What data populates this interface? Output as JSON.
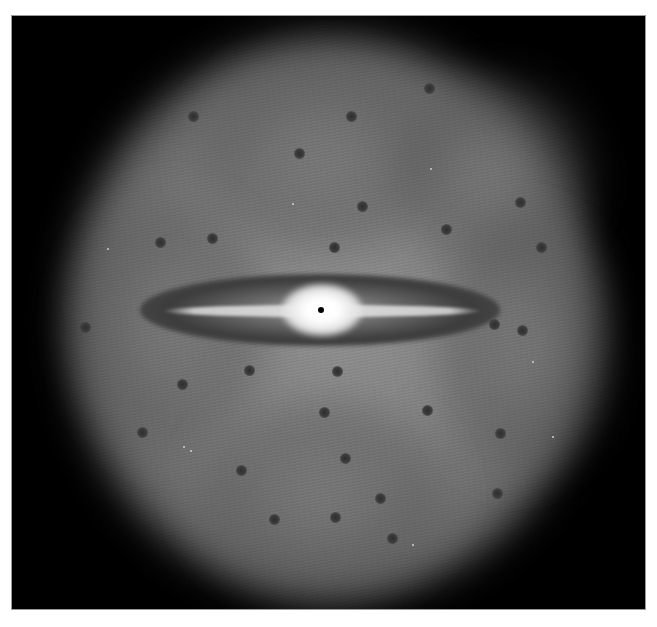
{
  "image": {
    "subject": "edge-on disk galaxy with bright central bulge and diffuse halo",
    "frame": {
      "left": 12,
      "top": 16,
      "width": 633,
      "height": 593
    },
    "colors": {
      "background": "#000000",
      "halo": "#858585",
      "disk_dark": "#3c3c3c",
      "bulge": "#ffffff",
      "border": "#9a9a9a"
    },
    "core": {
      "x": 309,
      "y": 294
    },
    "halo_lobes": [
      {
        "x": 180,
        "y": 40,
        "w": 260,
        "h": 200
      },
      {
        "x": 380,
        "y": 60,
        "w": 200,
        "h": 200
      },
      {
        "x": 60,
        "y": 180,
        "w": 200,
        "h": 260
      },
      {
        "x": 420,
        "y": 200,
        "w": 180,
        "h": 260
      },
      {
        "x": 180,
        "y": 380,
        "w": 260,
        "h": 200
      }
    ],
    "dark_spots": [
      {
        "x": 181,
        "y": 100
      },
      {
        "x": 339,
        "y": 100
      },
      {
        "x": 417,
        "y": 72
      },
      {
        "x": 287,
        "y": 137
      },
      {
        "x": 350,
        "y": 190
      },
      {
        "x": 200,
        "y": 222
      },
      {
        "x": 322,
        "y": 231
      },
      {
        "x": 434,
        "y": 213
      },
      {
        "x": 529,
        "y": 231
      },
      {
        "x": 508,
        "y": 186
      },
      {
        "x": 73,
        "y": 311
      },
      {
        "x": 482,
        "y": 308
      },
      {
        "x": 510,
        "y": 314
      },
      {
        "x": 237,
        "y": 354
      },
      {
        "x": 325,
        "y": 355
      },
      {
        "x": 170,
        "y": 368
      },
      {
        "x": 312,
        "y": 396
      },
      {
        "x": 415,
        "y": 394
      },
      {
        "x": 130,
        "y": 416
      },
      {
        "x": 488,
        "y": 417
      },
      {
        "x": 333,
        "y": 442
      },
      {
        "x": 229,
        "y": 454
      },
      {
        "x": 368,
        "y": 482
      },
      {
        "x": 485,
        "y": 477
      },
      {
        "x": 262,
        "y": 503
      },
      {
        "x": 323,
        "y": 501
      },
      {
        "x": 380,
        "y": 522
      },
      {
        "x": 148,
        "y": 226
      }
    ],
    "stars": [
      {
        "x": 280,
        "y": 187
      },
      {
        "x": 418,
        "y": 152
      },
      {
        "x": 178,
        "y": 434
      },
      {
        "x": 171,
        "y": 430
      },
      {
        "x": 540,
        "y": 420
      },
      {
        "x": 520,
        "y": 345
      },
      {
        "x": 95,
        "y": 232
      },
      {
        "x": 400,
        "y": 528
      }
    ]
  }
}
